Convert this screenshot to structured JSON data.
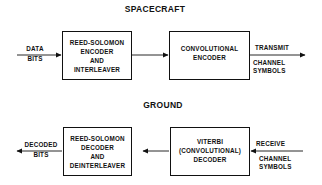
{
  "spacecraft": {
    "title": "SPACECRAFT",
    "input_label_top": "DATA",
    "input_label_bottom": "BITS",
    "box1": {
      "line1": "REED-SOLOMON",
      "line2": "ENCODER",
      "line3": "AND",
      "line4": "INTERLEAVER"
    },
    "box2": {
      "line1": "CONVOLUTIONAL",
      "line2": "ENCODER"
    },
    "output_label_top": "TRANSMIT",
    "output_label_line2": "CHANNEL",
    "output_label_line3": "SYMBOLS"
  },
  "ground": {
    "title": "GROUND",
    "input_label_top": "RECEIVE",
    "input_label_line2": "CHANNEL",
    "input_label_line3": "SYMBOLS",
    "box1": {
      "line1": "VITERBI",
      "line2": "(CONVOLUTIONAL)",
      "line3": "DECODER"
    },
    "box2": {
      "line1": "REED-SOLOMON",
      "line2": "DECODER",
      "line3": "AND",
      "line4": "DEINTERLEAVER"
    },
    "output_label_top": "DECODED",
    "output_label_bottom": "BITS"
  },
  "colors": {
    "stroke": "#111111",
    "background": "#ffffff"
  }
}
